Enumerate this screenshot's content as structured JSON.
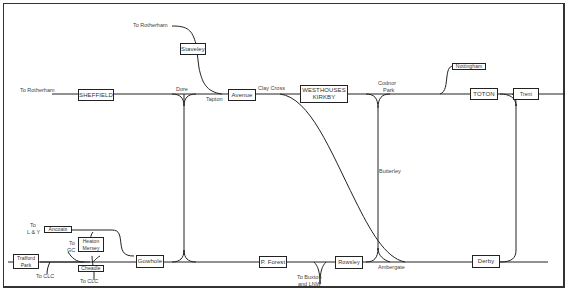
{
  "diagram": {
    "type": "railway-route-diagram",
    "line_color": "#222222",
    "stations": [
      {
        "id": "sheffield",
        "label": "SHEFFIELD"
      },
      {
        "id": "staveley",
        "label": "Staveley"
      },
      {
        "id": "avenue",
        "label": "Avenue"
      },
      {
        "id": "westhouses",
        "label": "WESTHOUSES KIRKBY",
        "line1": "WESTHOUSES",
        "line2": "KIRKBY"
      },
      {
        "id": "nottingham",
        "label": "Nottingham"
      },
      {
        "id": "toton",
        "label": "TOTON"
      },
      {
        "id": "trent",
        "label": "Trent"
      },
      {
        "id": "ancoats",
        "label": "Ancoats"
      },
      {
        "id": "heaton-mersey",
        "label": "Heaton Mersey",
        "line1": "Heaton",
        "line2": "Mersey"
      },
      {
        "id": "trafford-park",
        "label": "Trafford Park",
        "line1": "Trafford",
        "line2": "Park"
      },
      {
        "id": "cheadle",
        "label": "Cheadle"
      },
      {
        "id": "gowhole",
        "label": "Gowhole"
      },
      {
        "id": "p-forest",
        "label": "P. Forest"
      },
      {
        "id": "rowsley",
        "label": "Rowsley"
      },
      {
        "id": "derby",
        "label": "Derby"
      }
    ],
    "labels": {
      "to_rotherham_top": "To Rotherham",
      "to_rotherham_left": "To Rotherham",
      "dore": "Dore",
      "tapton": "Tapton",
      "clay_cross": "Clay Cross",
      "codnor_1": "Codnor",
      "codnor_2": "Park",
      "butterley": "Butterley",
      "ambergate": "Ambergate",
      "to_buxton_1": "To Buxton",
      "to_buxton_2": "and LNW",
      "to_ly_1": "To",
      "to_ly_2": "L & Y",
      "to_gc_1": "To",
      "to_gc_2": "GC",
      "to_clc_left": "To CLC",
      "to_clc_right": "To CLC"
    }
  }
}
